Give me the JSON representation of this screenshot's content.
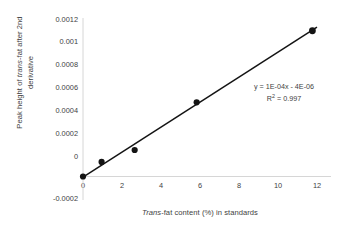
{
  "chart_data": {
    "type": "scatter",
    "title": "",
    "xlabel_parts": {
      "italic": "Trans",
      "rest": "-fat content (%) in standards"
    },
    "ylabel_line1_parts": {
      "pre": "Peak height of ",
      "italic": "trans",
      "post": "-fat after 2nd"
    },
    "ylabel_line2": "derivative",
    "xlabel": "Trans-fat content (%) in standards",
    "ylabel": "Peak height of trans-fat after 2nd derivative",
    "x": [
      0,
      0.9,
      2.5,
      5.5,
      11.1
    ],
    "values": [
      0,
      0.00011,
      0.0002,
      0.00056,
      0.0011
    ],
    "series": [
      {
        "name": "Standards",
        "points": [
          {
            "x": 0,
            "y": 0
          },
          {
            "x": 0.9,
            "y": 0.00011
          },
          {
            "x": 2.5,
            "y": 0.0002
          },
          {
            "x": 5.5,
            "y": 0.00056
          },
          {
            "x": 11.1,
            "y": 0.0011
          }
        ]
      }
    ],
    "trendline": {
      "slope": 0.0001,
      "intercept": -4e-06,
      "equation": "y = 1E-04x - 4E-06",
      "r_squared_label": "R",
      "r_squared_sup": "2",
      "r_squared_value": " = 0.997",
      "r_squared": 0.997
    },
    "xlim": [
      0,
      12
    ],
    "ylim": [
      -0.0002,
      0.0012
    ],
    "xticks": [
      0,
      2,
      4,
      6,
      8,
      10,
      12
    ],
    "xtick_labels": [
      "0",
      "2",
      "4",
      "6",
      "8",
      "10",
      "12"
    ],
    "yticks": [
      -0.0002,
      0,
      0.0002,
      0.0004,
      0.0006,
      0.0008,
      0.001,
      0.0012
    ],
    "ytick_labels": [
      "-0.0002",
      "0",
      "0.0002",
      "0.0004",
      "0.0006",
      "0.0008",
      "0.001",
      "0.0012"
    ],
    "grid": false,
    "legend": "none",
    "colors": {
      "marker": "#141414",
      "trendline": "#141414",
      "axis": "#d4d4d4",
      "text": "#3f3f3f",
      "background": "#ffffff"
    }
  }
}
